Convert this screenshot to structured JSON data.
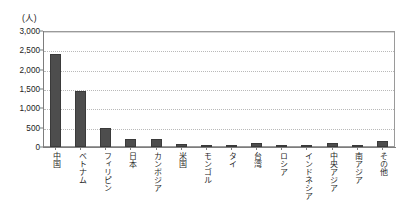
{
  "chart_data": {
    "type": "bar",
    "title": "",
    "subtitle": "",
    "unit_label": "(人)",
    "xlabel": "",
    "ylabel": "",
    "ylim": [
      0,
      3000
    ],
    "ytick_values": [
      0,
      500,
      1000,
      1500,
      2000,
      2500,
      3000
    ],
    "ytick_labels": [
      "0",
      "500",
      "1,000",
      "1,500",
      "2,000",
      "2,500",
      "3,000"
    ],
    "grid": true,
    "grid_axis": "y",
    "legend": false,
    "legend_position": "none",
    "bar_color": "#4d4d4d",
    "categories": [
      "中国",
      "ベトナム",
      "フィリピン",
      "日本",
      "カンボジア",
      "米国",
      "モンゴル",
      "タイ",
      "台湾",
      "ロシア",
      "インドネシア",
      "中央アジア",
      "南アジア",
      "その他"
    ],
    "values": [
      2410,
      1450,
      490,
      210,
      215,
      90,
      45,
      45,
      95,
      50,
      25,
      110,
      40,
      160
    ]
  },
  "colors": {
    "bar": "#4d4d4d",
    "bar_border": "#3a3a3a",
    "axis": "#7d7d7d",
    "plot_border": "#9a9a9a",
    "gridline": "#b9b9b9",
    "text": "#1f1f1f",
    "background": "#ffffff"
  }
}
